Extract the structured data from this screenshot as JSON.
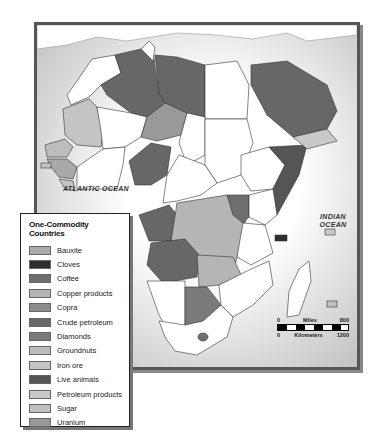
{
  "map": {
    "oceans": {
      "atlantic": "ATLANTIC OCEAN",
      "indian": "INDIAN OCEAN"
    },
    "scale": {
      "miles_start": "0",
      "miles_label": "Miles",
      "miles_end": "800",
      "km_start": "0",
      "km_label": "Kilometers",
      "km_end": "1200"
    }
  },
  "legend": {
    "title": "One-Commodity Countries",
    "items": [
      {
        "label": "Bauxite",
        "color": "#a9a9a9"
      },
      {
        "label": "Cloves",
        "color": "#2e2e2e"
      },
      {
        "label": "Coffee",
        "color": "#6e6e6e"
      },
      {
        "label": "Copper products",
        "color": "#b5b5b5"
      },
      {
        "label": "Copra",
        "color": "#8e8e8e"
      },
      {
        "label": "Crude petroleum",
        "color": "#676767"
      },
      {
        "label": "Diamonds",
        "color": "#7a7a7a"
      },
      {
        "label": "Groundnuts",
        "color": "#bdbdbd"
      },
      {
        "label": "Iron ore",
        "color": "#c4c4c4"
      },
      {
        "label": "Live animals",
        "color": "#555555"
      },
      {
        "label": "Petroleum products",
        "color": "#c9c9c9"
      },
      {
        "label": "Sugar",
        "color": "#c0c0c0"
      },
      {
        "label": "Uranium",
        "color": "#999999"
      }
    ]
  }
}
